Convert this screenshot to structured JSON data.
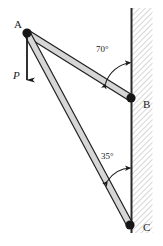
{
  "figure": {
    "type": "statics-truss-diagram",
    "width": 163,
    "height": 246,
    "background": "#ffffff",
    "stroke_color": "#1a1a1a",
    "member_fill": "#d4d4d4",
    "wall_hatch_color": "#b0b0b0"
  },
  "labels": {
    "node_a": "A",
    "node_b": "B",
    "node_c": "C",
    "force_p": "P",
    "angle_ab": "70°",
    "angle_ac": "35°"
  },
  "geometry": {
    "joints": [
      {
        "name": "A",
        "x": 27,
        "y": 33,
        "type": "pin"
      },
      {
        "name": "B",
        "x": 131,
        "y": 98,
        "type": "pin"
      },
      {
        "name": "C",
        "x": 130,
        "y": 225,
        "type": "pin"
      }
    ],
    "members": [
      {
        "name": "AB",
        "from": "A",
        "to": "B",
        "thickness": 7
      },
      {
        "name": "AC",
        "from": "A",
        "to": "C",
        "thickness": 7
      }
    ],
    "wall": {
      "x": 131,
      "y_top": 8,
      "y_bottom": 233,
      "hatch_width": 21
    },
    "load": {
      "at": "A",
      "direction": "down",
      "x": 27,
      "y_start": 33,
      "y_end": 88
    }
  },
  "angles": {
    "ab_to_wall": 70,
    "ac_to_wall": 35
  }
}
